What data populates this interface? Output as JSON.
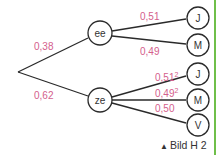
{
  "diagram": {
    "type": "probability-tree",
    "root": {
      "x": 18,
      "y": 72
    },
    "level1": [
      {
        "label": "ee",
        "prob": "0,38",
        "x": 100,
        "y": 33
      },
      {
        "label": "ze",
        "prob": "0,62",
        "x": 100,
        "y": 100
      }
    ],
    "level2_ee": [
      {
        "label": "J",
        "prob": "0,51",
        "exp": "",
        "x": 198,
        "y": 18
      },
      {
        "label": "M",
        "prob": "0,49",
        "exp": "",
        "x": 198,
        "y": 45
      }
    ],
    "level2_ze": [
      {
        "label": "J",
        "prob": "0,51",
        "exp": "2",
        "x": 198,
        "y": 74
      },
      {
        "label": "M",
        "prob": "0,49",
        "exp": "2",
        "x": 198,
        "y": 100
      },
      {
        "label": "V",
        "prob": "0,50",
        "exp": "",
        "x": 198,
        "y": 125
      }
    ],
    "colors": {
      "probability": "#d4608c",
      "lines": "#2a2a2a",
      "rule": "#6fbf4a"
    }
  },
  "caption": {
    "marker": "▲",
    "text": "Bild H 2"
  }
}
